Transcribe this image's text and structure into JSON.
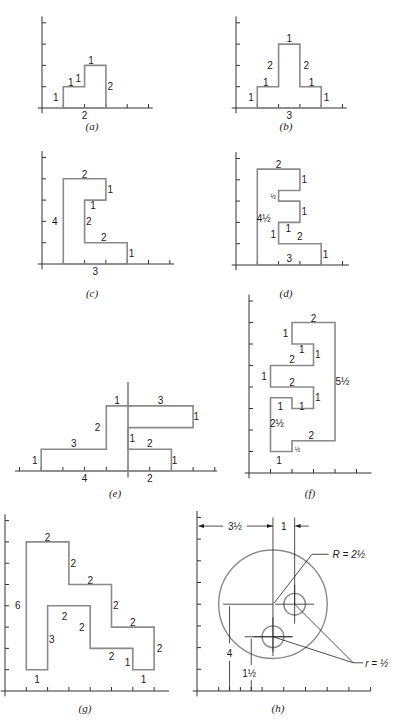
{
  "figure": {
    "panels": [
      {
        "id": "a",
        "caption": "(a)",
        "outline": [
          [
            1,
            0
          ],
          [
            3,
            0
          ],
          [
            3,
            2
          ],
          [
            2,
            2
          ],
          [
            2,
            1
          ],
          [
            1,
            1
          ]
        ],
        "labels": [
          {
            "text": "1",
            "at": [
              2.3,
              2.25
            ]
          },
          {
            "text": "2",
            "at": [
              3.2,
              1.0
            ]
          },
          {
            "text": "2",
            "at": [
              2.0,
              -0.35
            ]
          },
          {
            "text": "1",
            "at": [
              0.65,
              0.5
            ]
          },
          {
            "text": "1",
            "at": [
              1.35,
              1.2
            ]
          },
          {
            "text": "1",
            "at": [
              1.7,
              1.4
            ]
          }
        ]
      },
      {
        "id": "b",
        "caption": "(b)",
        "outline": [
          [
            1,
            0
          ],
          [
            4,
            0
          ],
          [
            4,
            1
          ],
          [
            3,
            1
          ],
          [
            3,
            3
          ],
          [
            2,
            3
          ],
          [
            2,
            1
          ],
          [
            1,
            1
          ]
        ],
        "labels": [
          {
            "text": "1",
            "at": [
              2.5,
              3.25
            ]
          },
          {
            "text": "2",
            "at": [
              1.6,
              2.0
            ]
          },
          {
            "text": "2",
            "at": [
              3.3,
              2.0
            ]
          },
          {
            "text": "1",
            "at": [
              1.4,
              1.2
            ]
          },
          {
            "text": "1",
            "at": [
              3.55,
              1.2
            ]
          },
          {
            "text": "1",
            "at": [
              0.7,
              0.5
            ]
          },
          {
            "text": "1",
            "at": [
              4.25,
              0.5
            ]
          },
          {
            "text": "3",
            "at": [
              2.5,
              -0.35
            ]
          }
        ]
      },
      {
        "id": "c",
        "caption": "(c)",
        "outline": [
          [
            1,
            0
          ],
          [
            4,
            0
          ],
          [
            4,
            1
          ],
          [
            2,
            1
          ],
          [
            2,
            3
          ],
          [
            3,
            3
          ],
          [
            3,
            4
          ],
          [
            1,
            4
          ]
        ],
        "labels": [
          {
            "text": "2",
            "at": [
              2.0,
              4.2
            ]
          },
          {
            "text": "1",
            "at": [
              3.2,
              3.5
            ]
          },
          {
            "text": "1",
            "at": [
              2.4,
              2.75
            ]
          },
          {
            "text": "2",
            "at": [
              2.2,
              2.0
            ]
          },
          {
            "text": "4",
            "at": [
              0.6,
              2.0
            ]
          },
          {
            "text": "2",
            "at": [
              2.9,
              1.25
            ]
          },
          {
            "text": "1",
            "at": [
              4.2,
              0.5
            ]
          },
          {
            "text": "3",
            "at": [
              2.5,
              -0.35
            ]
          }
        ]
      },
      {
        "id": "d",
        "caption": "(d)",
        "outline": [
          [
            1,
            0
          ],
          [
            4,
            0
          ],
          [
            4,
            1
          ],
          [
            2,
            1
          ],
          [
            2,
            2
          ],
          [
            3,
            2
          ],
          [
            3,
            3
          ],
          [
            2,
            3
          ],
          [
            2,
            3.5
          ],
          [
            3,
            3.5
          ],
          [
            3,
            4.5
          ],
          [
            1,
            4.5
          ]
        ],
        "labels": [
          {
            "text": "2",
            "at": [
              2.0,
              4.7
            ]
          },
          {
            "text": "1",
            "at": [
              3.2,
              4.0
            ]
          },
          {
            "text": "½",
            "at": [
              1.75,
              3.25
            ],
            "frac": true
          },
          {
            "text": "1",
            "at": [
              3.2,
              2.5
            ]
          },
          {
            "text": "4½",
            "at": [
              1.3,
              2.2
            ]
          },
          {
            "text": "1",
            "at": [
              2.45,
              1.7
            ]
          },
          {
            "text": "1",
            "at": [
              1.75,
              1.45
            ]
          },
          {
            "text": "2",
            "at": [
              3.0,
              1.35
            ]
          },
          {
            "text": "1",
            "at": [
              4.2,
              0.5
            ]
          },
          {
            "text": "3",
            "at": [
              2.5,
              0.3
            ]
          }
        ]
      },
      {
        "id": "e",
        "caption": "(e)",
        "outline": [
          [
            -4,
            0
          ],
          [
            2,
            0
          ],
          [
            2,
            1
          ],
          [
            0,
            1
          ],
          [
            0,
            2
          ],
          [
            3,
            2
          ],
          [
            3,
            3
          ],
          [
            -1,
            3
          ],
          [
            -1,
            1
          ],
          [
            -4,
            1
          ]
        ],
        "labels": [
          {
            "text": "1",
            "at": [
              -0.5,
              3.25
            ]
          },
          {
            "text": "3",
            "at": [
              1.5,
              3.25
            ]
          },
          {
            "text": "1",
            "at": [
              3.15,
              2.5
            ]
          },
          {
            "text": "2",
            "at": [
              -1.4,
              2.0
            ]
          },
          {
            "text": "1",
            "at": [
              0.2,
              1.5
            ]
          },
          {
            "text": "2",
            "at": [
              1.0,
              1.25
            ]
          },
          {
            "text": "3",
            "at": [
              -2.5,
              1.25
            ]
          },
          {
            "text": "1",
            "at": [
              -4.3,
              0.5
            ]
          },
          {
            "text": "1",
            "at": [
              2.15,
              0.5
            ]
          },
          {
            "text": "4",
            "at": [
              -2.0,
              -0.35
            ]
          },
          {
            "text": "2",
            "at": [
              1.0,
              -0.35
            ]
          }
        ]
      },
      {
        "id": "f",
        "caption": "(f)",
        "outline": [
          [
            1,
            1
          ],
          [
            2,
            1
          ],
          [
            2,
            1.5
          ],
          [
            4,
            1.5
          ],
          [
            4,
            7
          ],
          [
            2,
            7
          ],
          [
            2,
            6
          ],
          [
            3,
            6
          ],
          [
            3,
            5
          ],
          [
            1,
            5
          ],
          [
            1,
            4
          ],
          [
            3,
            4
          ],
          [
            3,
            3
          ],
          [
            2,
            3
          ],
          [
            2,
            3.5
          ],
          [
            1,
            3.5
          ]
        ],
        "labels": [
          {
            "text": "2",
            "at": [
              3.0,
              7.2
            ]
          },
          {
            "text": "1",
            "at": [
              1.7,
              6.5
            ]
          },
          {
            "text": "1",
            "at": [
              2.45,
              5.75
            ]
          },
          {
            "text": "1",
            "at": [
              3.2,
              5.5
            ]
          },
          {
            "text": "2",
            "at": [
              2.0,
              5.3
            ]
          },
          {
            "text": "1",
            "at": [
              0.7,
              4.5
            ]
          },
          {
            "text": "2",
            "at": [
              2.0,
              4.2
            ]
          },
          {
            "text": "5½",
            "at": [
              4.35,
              4.25
            ]
          },
          {
            "text": "1",
            "at": [
              1.45,
              3.1
            ]
          },
          {
            "text": "1",
            "at": [
              2.45,
              3.1
            ]
          },
          {
            "text": "1",
            "at": [
              3.2,
              3.5
            ]
          },
          {
            "text": "2½",
            "at": [
              1.3,
              2.3
            ]
          },
          {
            "text": "2",
            "at": [
              2.9,
              1.75
            ]
          },
          {
            "text": "½",
            "at": [
              2.25,
              1.15
            ],
            "frac": true
          },
          {
            "text": "1",
            "at": [
              1.4,
              0.6
            ]
          }
        ]
      },
      {
        "id": "g",
        "caption": "(g)",
        "outline": [
          [
            1,
            1
          ],
          [
            2,
            1
          ],
          [
            2,
            4
          ],
          [
            4,
            4
          ],
          [
            4,
            2
          ],
          [
            6,
            2
          ],
          [
            6,
            1
          ],
          [
            7,
            1
          ],
          [
            7,
            3
          ],
          [
            5,
            3
          ],
          [
            5,
            5
          ],
          [
            3,
            5
          ],
          [
            3,
            7
          ],
          [
            1,
            7
          ]
        ],
        "labels": [
          {
            "text": "2",
            "at": [
              2.0,
              7.2
            ]
          },
          {
            "text": "2",
            "at": [
              3.2,
              6.0
            ]
          },
          {
            "text": "2",
            "at": [
              4.0,
              5.2
            ]
          },
          {
            "text": "6",
            "at": [
              0.6,
              4.0
            ]
          },
          {
            "text": "2",
            "at": [
              5.2,
              4.0
            ]
          },
          {
            "text": "2",
            "at": [
              2.8,
              3.5
            ]
          },
          {
            "text": "2",
            "at": [
              6.0,
              3.2
            ]
          },
          {
            "text": "2",
            "at": [
              3.6,
              3.0
            ]
          },
          {
            "text": "3",
            "at": [
              2.2,
              2.4
            ]
          },
          {
            "text": "2",
            "at": [
              7.25,
              2.0
            ]
          },
          {
            "text": "2",
            "at": [
              5.0,
              1.6
            ]
          },
          {
            "text": "1",
            "at": [
              5.75,
              1.35
            ]
          },
          {
            "text": "1",
            "at": [
              1.5,
              0.55
            ]
          },
          {
            "text": "1",
            "at": [
              6.5,
              0.55
            ]
          }
        ]
      },
      {
        "id": "h",
        "caption": "(h)",
        "big_circle": {
          "center": [
            3.5,
            4
          ],
          "radius": 2.5
        },
        "small_circles": [
          {
            "center": [
              4.5,
              4
            ],
            "radius": 0.5
          },
          {
            "center": [
              3.5,
              2.5
            ],
            "radius": 0.5
          }
        ],
        "labels": {
          "horizontal_offset": "3½",
          "hole_spacing": "1",
          "big_radius": "R = 2½",
          "small_radius": "r = ½",
          "vertical_center": "4",
          "vertical_hole": "1½"
        }
      }
    ]
  }
}
